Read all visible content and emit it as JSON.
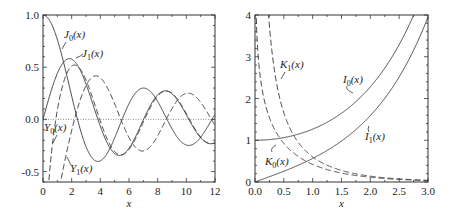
{
  "chart_data": [
    {
      "type": "line",
      "title": "",
      "xlabel": "x",
      "ylabel": "",
      "xlim": [
        0,
        12
      ],
      "ylim": [
        -0.6,
        1.0
      ],
      "grid": false,
      "zero_line": {
        "y": 0,
        "style": "dotted"
      },
      "x_ticks": [
        "0",
        "2",
        "4",
        "6",
        "8",
        "10",
        "12"
      ],
      "y_ticks": [
        "-0.5",
        "0.0",
        "0.5",
        "1.0"
      ],
      "x_tick_values": [
        0,
        2,
        4,
        6,
        8,
        10,
        12
      ],
      "y_tick_values": [
        -0.5,
        0.0,
        0.5,
        1.0
      ],
      "x": [
        0,
        1,
        2,
        3,
        4,
        5,
        6,
        7,
        8,
        9,
        10,
        11,
        12
      ],
      "series": [
        {
          "name": "J0(x)",
          "style": "solid",
          "values": [
            1.0,
            0.765,
            0.224,
            -0.26,
            -0.397,
            -0.178,
            0.151,
            0.3,
            0.172,
            -0.09,
            -0.246,
            -0.171,
            0.048
          ]
        },
        {
          "name": "J1(x)",
          "style": "solid",
          "values": [
            0.0,
            0.44,
            0.577,
            0.339,
            -0.066,
            -0.328,
            -0.277,
            -0.005,
            0.235,
            0.245,
            0.043,
            -0.177,
            -0.223
          ]
        },
        {
          "name": "Y0(x)",
          "style": "dashed",
          "values": [
            null,
            0.088,
            0.51,
            0.377,
            -0.017,
            -0.309,
            -0.288,
            -0.026,
            0.224,
            0.25,
            0.056,
            -0.164,
            -0.225
          ]
        },
        {
          "name": "Y1(x)",
          "style": "dashed",
          "values": [
            null,
            -0.781,
            -0.107,
            0.325,
            0.398,
            0.148,
            -0.175,
            -0.303,
            -0.158,
            0.104,
            0.249,
            0.164,
            -0.057
          ]
        }
      ],
      "labels": [
        {
          "text": "J0(x)",
          "base": "J",
          "sub": "0",
          "arg": "(x)",
          "x": 64,
          "y": 38
        },
        {
          "text": "J1(x)",
          "base": "J",
          "sub": "1",
          "arg": "(x)",
          "x": 82,
          "y": 57
        },
        {
          "text": "Y0(x)",
          "base": "Y",
          "sub": "0",
          "arg": "(x)",
          "x": 44,
          "y": 131
        },
        {
          "text": "Y1(x)",
          "base": "Y",
          "sub": "1",
          "arg": "(x)",
          "x": 70,
          "y": 172
        }
      ]
    },
    {
      "type": "line",
      "title": "",
      "xlabel": "x",
      "ylabel": "",
      "xlim": [
        0,
        3
      ],
      "ylim": [
        0,
        4
      ],
      "grid": false,
      "x_ticks": [
        "0.0",
        "0.5",
        "1.0",
        "1.5",
        "2.0",
        "2.5",
        "3.0"
      ],
      "y_ticks": [
        "0",
        "1",
        "2",
        "3",
        "4"
      ],
      "x_tick_values": [
        0,
        0.5,
        1.0,
        1.5,
        2.0,
        2.5,
        3.0
      ],
      "y_tick_values": [
        0,
        1,
        2,
        3,
        4
      ],
      "x": [
        0.0,
        0.25,
        0.5,
        0.75,
        1.0,
        1.5,
        2.0,
        2.5,
        3.0
      ],
      "series": [
        {
          "name": "I0(x)",
          "style": "solid",
          "values": [
            1.0,
            1.016,
            1.063,
            1.146,
            1.266,
            1.647,
            2.28,
            3.29,
            4.881
          ]
        },
        {
          "name": "I1(x)",
          "style": "solid",
          "values": [
            0.0,
            0.126,
            0.258,
            0.401,
            0.565,
            0.982,
            1.591,
            2.517,
            3.953
          ]
        },
        {
          "name": "K0(x)",
          "style": "dashed",
          "values": [
            null,
            1.542,
            0.924,
            0.611,
            0.421,
            0.214,
            0.114,
            0.062,
            0.035
          ]
        },
        {
          "name": "K1(x)",
          "style": "dashed",
          "values": [
            null,
            3.747,
            1.656,
            0.95,
            0.602,
            0.277,
            0.14,
            0.074,
            0.04
          ]
        }
      ],
      "labels": [
        {
          "text": "K1(x)",
          "base": "K",
          "sub": "1",
          "arg": "(x)",
          "x": 280,
          "y": 68
        },
        {
          "text": "I0(x)",
          "base": "I",
          "sub": "0",
          "arg": "(x)",
          "x": 343,
          "y": 83
        },
        {
          "text": "I1(x)",
          "base": "I",
          "sub": "1",
          "arg": "(x)",
          "x": 365,
          "y": 140
        },
        {
          "text": "K0(x)",
          "base": "K",
          "sub": "0",
          "arg": "(x)",
          "x": 265,
          "y": 165
        }
      ]
    }
  ]
}
